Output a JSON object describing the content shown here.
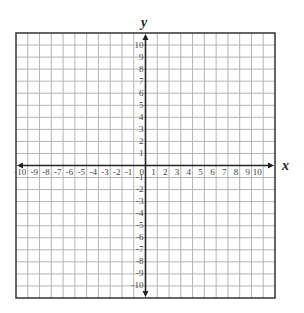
{
  "diagram": {
    "type": "coordinate-plane",
    "x_axis_label": "x",
    "y_axis_label": "y",
    "x_range": [
      -10,
      10
    ],
    "y_range": [
      -10,
      10
    ],
    "grid_cells": 22,
    "x_tick_labels": [
      "-10",
      "-9",
      "-8",
      "-7",
      "-6",
      "-5",
      "-4",
      "-3",
      "-2",
      "-1",
      "0",
      "1",
      "2",
      "3",
      "4",
      "5",
      "6",
      "7",
      "8",
      "9",
      "10"
    ],
    "y_tick_labels": [
      "10",
      "9",
      "8",
      "7",
      "6",
      "5",
      "4",
      "3",
      "2",
      "1",
      "-1",
      "-2",
      "-3",
      "-4",
      "-5",
      "-6",
      "-7",
      "-8",
      "-9",
      "-10"
    ],
    "colors": {
      "grid": "#b4b4b4",
      "border": "#333333",
      "axis": "#222222",
      "text": "#444444",
      "background": "#ffffff"
    }
  }
}
